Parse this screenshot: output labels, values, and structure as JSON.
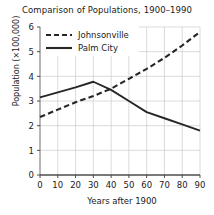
{
  "chart_data": {
    "type": "line",
    "title": "Comparison of Populations, 1900–1990",
    "xlabel": "Years after 1900",
    "ylabel": "Population (×100,000)",
    "xlim": [
      0,
      90
    ],
    "ylim": [
      0,
      6
    ],
    "xticks": [
      0,
      10,
      20,
      30,
      40,
      50,
      60,
      70,
      80,
      90
    ],
    "yticks": [
      0,
      1,
      2,
      3,
      4,
      5,
      6
    ],
    "xtick_labels": [
      "0",
      "10",
      "20",
      "30",
      "40",
      "50",
      "60",
      "70",
      "80",
      "90"
    ],
    "ytick_labels": [
      "0",
      "1",
      "2",
      "3",
      "4",
      "5",
      "6"
    ],
    "grid": true,
    "legend_position": "upper left",
    "series": [
      {
        "name": "Johnsonville",
        "style": "dashed",
        "color": "#262626",
        "x": [
          0,
          10,
          20,
          30,
          40,
          50,
          60,
          70,
          80,
          90
        ],
        "values": [
          2.35,
          2.65,
          2.95,
          3.2,
          3.5,
          3.9,
          4.3,
          4.75,
          5.25,
          5.8
        ]
      },
      {
        "name": "Palm City",
        "style": "solid",
        "color": "#262626",
        "x": [
          0,
          10,
          20,
          30,
          40,
          50,
          60,
          70,
          80,
          90
        ],
        "values": [
          3.15,
          3.35,
          3.55,
          3.78,
          3.45,
          3.0,
          2.55,
          2.3,
          2.05,
          1.8
        ]
      }
    ]
  }
}
